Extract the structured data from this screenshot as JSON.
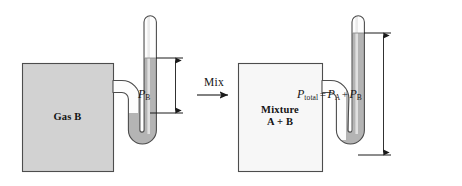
{
  "figure": {
    "width": 462,
    "height": 186
  },
  "colors": {
    "gas_b_fill": "#d2d2d2",
    "mixture_fill": "#f7f7f7",
    "mercury_fill": "#b4b4b4",
    "tube_empty_fill": "#fdfdfd",
    "outline": "#4d4d4d",
    "text": "#141414",
    "arrow": "#1a1a1a"
  },
  "left_panel": {
    "vessel_label_line1": "Gas B",
    "pressure_label": {
      "symbol": "P",
      "subscript": "B"
    }
  },
  "transition": {
    "label": "Mix"
  },
  "right_panel": {
    "vessel_label_line1": "Mixture",
    "vessel_label_line2": "A + B",
    "pressure_label": {
      "symbol": "P",
      "subscript": "total",
      "equals": "=",
      "term1_symbol": "P",
      "term1_subscript": "A",
      "plus": "+",
      "term2_symbol": "P",
      "term2_subscript": "B"
    }
  }
}
